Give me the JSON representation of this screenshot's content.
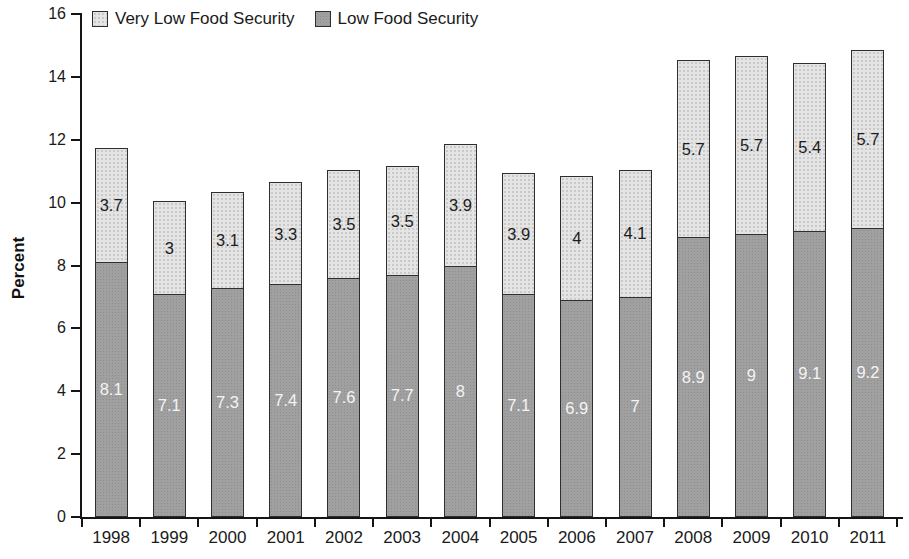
{
  "chart_data": {
    "type": "bar",
    "stacked": true,
    "title": "",
    "xlabel": "",
    "ylabel": "Percent",
    "ylim": [
      0,
      16
    ],
    "yticks": [
      0,
      2,
      4,
      6,
      8,
      10,
      12,
      14,
      16
    ],
    "grid": false,
    "legend_position": "top-left",
    "categories": [
      "1998",
      "1999",
      "2000",
      "2001",
      "2002",
      "2003",
      "2004",
      "2005",
      "2006",
      "2007",
      "2008",
      "2009",
      "2010",
      "2011"
    ],
    "series": [
      {
        "name": "Low Food Security",
        "position": "bottom",
        "color": "#a0a0a0",
        "label_color": "#f4f4f4",
        "values": [
          8.1,
          7.1,
          7.3,
          7.4,
          7.6,
          7.7,
          8,
          7.1,
          6.9,
          7,
          8.9,
          9,
          9.1,
          9.2
        ],
        "labels": [
          "8.1",
          "7.1",
          "7.3",
          "7.4",
          "7.6",
          "7.7",
          "8",
          "7.1",
          "6.9",
          "7",
          "8.9",
          "9",
          "9.1",
          "9.2"
        ]
      },
      {
        "name": "Very Low Food Security",
        "position": "top",
        "color": "#e4e4e4",
        "label_color": "#1c1c1c",
        "values": [
          3.7,
          3,
          3.1,
          3.3,
          3.5,
          3.5,
          3.9,
          3.9,
          4,
          4.1,
          5.7,
          5.7,
          5.4,
          5.7
        ],
        "labels": [
          "3.7",
          "3",
          "3.1",
          "3.3",
          "3.5",
          "3.5",
          "3.9",
          "3.9",
          "4",
          "4.1",
          "5.7",
          "5.7",
          "5.4",
          "5.7"
        ]
      }
    ],
    "legend": [
      "Very Low Food Security",
      "Low Food Security"
    ]
  }
}
